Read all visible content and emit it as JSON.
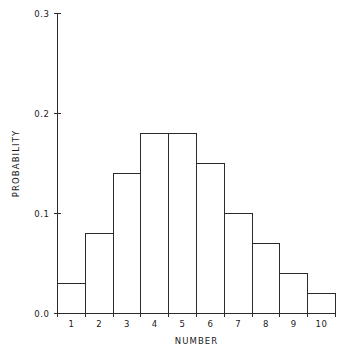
{
  "chart_data": {
    "type": "bar",
    "title": "",
    "xlabel": "NUMBER",
    "ylabel": "PROBABILITY",
    "categories": [
      "1",
      "2",
      "3",
      "4",
      "5",
      "6",
      "7",
      "8",
      "9",
      "10"
    ],
    "values": [
      0.03,
      0.08,
      0.14,
      0.18,
      0.18,
      0.15,
      0.1,
      0.07,
      0.04,
      0.02
    ],
    "xlim": [
      0.5,
      10.5
    ],
    "ylim": [
      0.0,
      0.3
    ],
    "ytick_labels": [
      "0.0",
      "0.1",
      "0.2",
      "0.3"
    ],
    "ytick_values": [
      0.0,
      0.1,
      0.2,
      0.3
    ],
    "xtick_labels": [
      "1",
      "2",
      "3",
      "4",
      "5",
      "6",
      "7",
      "8",
      "9",
      "10"
    ],
    "grid": false,
    "legend": null,
    "style": {
      "bar_fill": "#ffffff",
      "bar_stroke": "#2b2b2b",
      "axis_color": "#2b2b2b",
      "text_color": "#1a1a1a",
      "background": "#ffffff"
    }
  }
}
